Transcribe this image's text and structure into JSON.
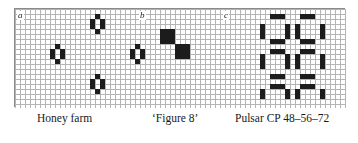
{
  "figure": {
    "name": "conway-life-still-lifes-and-oscillators",
    "background_color": "#ffffff",
    "grid": {
      "cell_size": 5,
      "cols": 66,
      "rows": 19,
      "line_color": "#b4b4b4",
      "border_color": "#8a8a8a",
      "cell_fill_color": "#1c1c1c"
    },
    "panels": [
      {
        "key": "a",
        "label": "a",
        "caption": "Honey farm",
        "pattern_name": "honey-farm",
        "live_cells": [
          [
            16,
            1
          ],
          [
            15,
            2
          ],
          [
            17,
            2
          ],
          [
            15,
            3
          ],
          [
            17,
            3
          ],
          [
            16,
            4
          ],
          [
            8,
            7
          ],
          [
            7,
            8
          ],
          [
            9,
            8
          ],
          [
            7,
            9
          ],
          [
            9,
            9
          ],
          [
            8,
            10
          ],
          [
            24,
            7
          ],
          [
            23,
            8
          ],
          [
            25,
            8
          ],
          [
            23,
            9
          ],
          [
            25,
            9
          ],
          [
            24,
            10
          ],
          [
            16,
            13
          ],
          [
            15,
            14
          ],
          [
            17,
            14
          ],
          [
            15,
            15
          ],
          [
            17,
            15
          ],
          [
            16,
            16
          ]
        ]
      },
      {
        "key": "b",
        "label": "b",
        "caption": "‘Figure 8’",
        "pattern_name": "figure-eight",
        "live_cells": [
          [
            29,
            4
          ],
          [
            30,
            4
          ],
          [
            31,
            4
          ],
          [
            29,
            5
          ],
          [
            30,
            5
          ],
          [
            31,
            5
          ],
          [
            29,
            6
          ],
          [
            30,
            6
          ],
          [
            31,
            6
          ],
          [
            32,
            7
          ],
          [
            33,
            7
          ],
          [
            34,
            7
          ],
          [
            32,
            8
          ],
          [
            33,
            8
          ],
          [
            34,
            8
          ],
          [
            32,
            9
          ],
          [
            33,
            9
          ],
          [
            34,
            9
          ]
        ]
      },
      {
        "key": "c",
        "label": "c",
        "caption": "Pulsar CP 48–56–72",
        "pattern_name": "pulsar",
        "live_cells": [
          [
            51,
            1
          ],
          [
            52,
            1
          ],
          [
            53,
            1
          ],
          [
            57,
            1
          ],
          [
            58,
            1
          ],
          [
            59,
            1
          ],
          [
            49,
            3
          ],
          [
            54,
            3
          ],
          [
            56,
            3
          ],
          [
            61,
            3
          ],
          [
            49,
            4
          ],
          [
            54,
            4
          ],
          [
            56,
            4
          ],
          [
            61,
            4
          ],
          [
            49,
            5
          ],
          [
            54,
            5
          ],
          [
            56,
            5
          ],
          [
            61,
            5
          ],
          [
            51,
            6
          ],
          [
            52,
            6
          ],
          [
            53,
            6
          ],
          [
            57,
            6
          ],
          [
            58,
            6
          ],
          [
            59,
            6
          ],
          [
            51,
            8
          ],
          [
            52,
            8
          ],
          [
            53,
            8
          ],
          [
            57,
            8
          ],
          [
            58,
            8
          ],
          [
            59,
            8
          ],
          [
            49,
            9
          ],
          [
            54,
            9
          ],
          [
            56,
            9
          ],
          [
            61,
            9
          ],
          [
            49,
            10
          ],
          [
            54,
            10
          ],
          [
            56,
            10
          ],
          [
            61,
            10
          ],
          [
            49,
            11
          ],
          [
            54,
            11
          ],
          [
            56,
            11
          ],
          [
            61,
            11
          ],
          [
            51,
            13
          ],
          [
            52,
            13
          ],
          [
            53,
            13
          ],
          [
            57,
            13
          ],
          [
            58,
            13
          ],
          [
            59,
            13
          ],
          [
            51,
            15
          ],
          [
            52,
            15
          ],
          [
            53,
            15
          ],
          [
            57,
            15
          ],
          [
            58,
            15
          ],
          [
            59,
            15
          ],
          [
            49,
            16
          ],
          [
            54,
            16
          ],
          [
            56,
            16
          ],
          [
            61,
            16
          ],
          [
            49,
            17
          ],
          [
            54,
            17
          ],
          [
            56,
            17
          ],
          [
            61,
            17
          ]
        ]
      }
    ]
  }
}
